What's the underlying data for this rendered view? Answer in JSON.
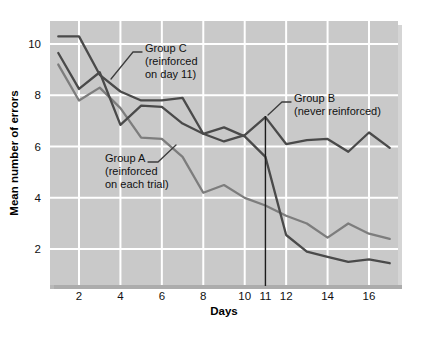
{
  "chart_data": {
    "type": "line",
    "title": "",
    "xlabel": "Days",
    "ylabel": "Mean number of errors",
    "xlim": [
      0.6,
      17.4
    ],
    "ylim": [
      0.6,
      10.9
    ],
    "xticks": [
      2,
      4,
      6,
      8,
      10,
      11,
      12,
      14,
      16
    ],
    "xticklabels": [
      "2",
      "4",
      "6",
      "8",
      "10",
      "11",
      "12",
      "14",
      "16"
    ],
    "yticks": [
      2,
      4,
      6,
      8,
      10
    ],
    "yticklabels": [
      "2",
      "4",
      "6",
      "8",
      "10"
    ],
    "grid": true,
    "grid_color": "#ffffff",
    "plot_background": "#c9c9c9",
    "legend_position": "inline-annotations",
    "x": [
      1,
      2,
      3,
      4,
      5,
      6,
      7,
      8,
      9,
      10,
      11,
      12,
      13,
      14,
      15,
      16,
      17
    ],
    "series": [
      {
        "name": "Group A",
        "annotation": "Group A\n(reinforced\non each trial)",
        "color": "#7d7d7d",
        "values": [
          9.2,
          7.8,
          8.3,
          7.5,
          6.35,
          6.3,
          5.6,
          4.2,
          4.5,
          4.0,
          3.7,
          3.3,
          3.0,
          2.45,
          3.0,
          2.6,
          2.4
        ]
      },
      {
        "name": "Group B",
        "annotation": "Group B\n(never reinforced)",
        "color": "#4a4a4a",
        "values": [
          9.65,
          8.25,
          8.9,
          6.85,
          7.6,
          7.55,
          6.9,
          6.5,
          6.2,
          6.45,
          7.15,
          6.1,
          6.25,
          6.3,
          5.8,
          6.55,
          5.95
        ]
      },
      {
        "name": "Group C",
        "annotation": "Group C\n(reinforced\non day 11)",
        "color": "#4a4a4a",
        "values": [
          10.3,
          10.3,
          8.8,
          8.15,
          7.8,
          7.8,
          7.9,
          6.5,
          6.75,
          6.4,
          5.6,
          2.55,
          1.9,
          1.7,
          1.5,
          1.6,
          1.45
        ]
      }
    ],
    "marker_line": {
      "name": "day-11-marker",
      "x": 11,
      "color": "#1c1c1c",
      "label": "11"
    },
    "annotations": [
      {
        "id": "group-c-annotation",
        "lines": [
          "Group C",
          "(reinforced",
          "on day 11)"
        ],
        "x": 145,
        "y": 52
      },
      {
        "id": "group-b-annotation",
        "lines": [
          "Group B",
          "(never reinforced)"
        ],
        "x": 294,
        "y": 102
      },
      {
        "id": "group-a-annotation",
        "lines": [
          "Group A",
          "(reinforced",
          "on each trial)"
        ],
        "x": 105,
        "y": 162
      }
    ]
  }
}
